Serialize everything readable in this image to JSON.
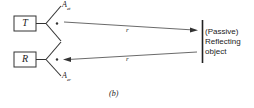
{
  "diagram": {
    "transmitter": {
      "label": "T",
      "antenna_label": "A",
      "antenna_sub": "et"
    },
    "receiver": {
      "label": "R",
      "antenna_label": "A",
      "antenna_sub": "er"
    },
    "paths": [
      {
        "label": "r",
        "direction": "to-object"
      },
      {
        "label": "r",
        "direction": "to-receiver"
      }
    ],
    "object": {
      "lines": [
        "(Passive)",
        "Reflecting",
        "object"
      ]
    },
    "caption": "(b)"
  }
}
